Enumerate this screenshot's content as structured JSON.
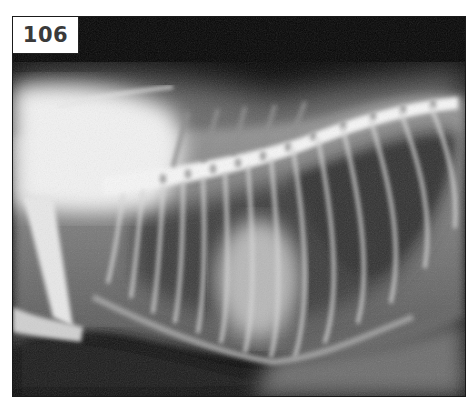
{
  "figure": {
    "label": "106",
    "colors": {
      "background": "#ffffff",
      "film_dark": "#000000",
      "bone": "#f4f4f4",
      "soft_tissue": "#8a8a8a",
      "lung_field": "#4a4a4a",
      "label_text": "#3a3a3a"
    }
  }
}
